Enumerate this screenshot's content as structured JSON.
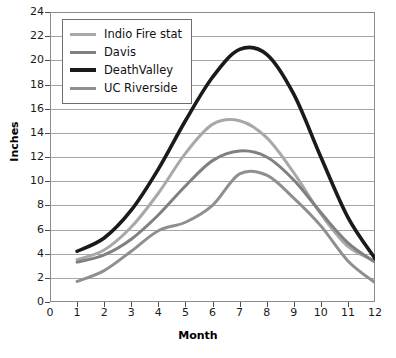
{
  "chart_data": {
    "type": "line",
    "title": "",
    "xlabel": "Month",
    "ylabel": "Inches",
    "xlim": [
      0,
      12
    ],
    "ylim": [
      0,
      24
    ],
    "xticks": [
      0,
      1,
      2,
      3,
      4,
      5,
      6,
      7,
      8,
      9,
      10,
      11,
      12
    ],
    "yticks": [
      0,
      2,
      4,
      6,
      8,
      10,
      12,
      14,
      16,
      18,
      20,
      22,
      24
    ],
    "grid": true,
    "legend_position": "upper left",
    "x": [
      1,
      2,
      3,
      4,
      5,
      6,
      7,
      8,
      9,
      10,
      11,
      12
    ],
    "series": [
      {
        "name": "Indio Fire stat",
        "color": "#a8a8a8",
        "width": 3,
        "values": [
          3.5,
          4.3,
          6.2,
          9.0,
          12.3,
          14.7,
          15.0,
          13.6,
          10.7,
          7.3,
          4.6,
          3.4
        ]
      },
      {
        "name": "Davis",
        "color": "#808080",
        "width": 3,
        "values": [
          3.3,
          3.9,
          5.2,
          7.2,
          9.6,
          11.7,
          12.5,
          12.0,
          10.1,
          7.4,
          4.9,
          3.3
        ]
      },
      {
        "name": "DeathValley",
        "color": "#1a1a1a",
        "width": 3.6,
        "values": [
          4.2,
          5.3,
          7.6,
          11.0,
          15.0,
          18.6,
          20.9,
          20.5,
          17.2,
          12.0,
          7.0,
          3.6
        ]
      },
      {
        "name": "UC Riverside",
        "color": "#8f8f8f",
        "width": 3,
        "values": [
          1.7,
          2.6,
          4.2,
          5.9,
          6.6,
          8.0,
          10.6,
          10.5,
          8.6,
          6.3,
          3.4,
          1.6
        ]
      }
    ]
  },
  "legend": {
    "items": [
      {
        "label": "Indio Fire stat"
      },
      {
        "label": "Davis"
      },
      {
        "label": "DeathValley"
      },
      {
        "label": "UC Riverside"
      }
    ]
  },
  "axes": {
    "y_title": "Inches",
    "x_title": "Month"
  }
}
